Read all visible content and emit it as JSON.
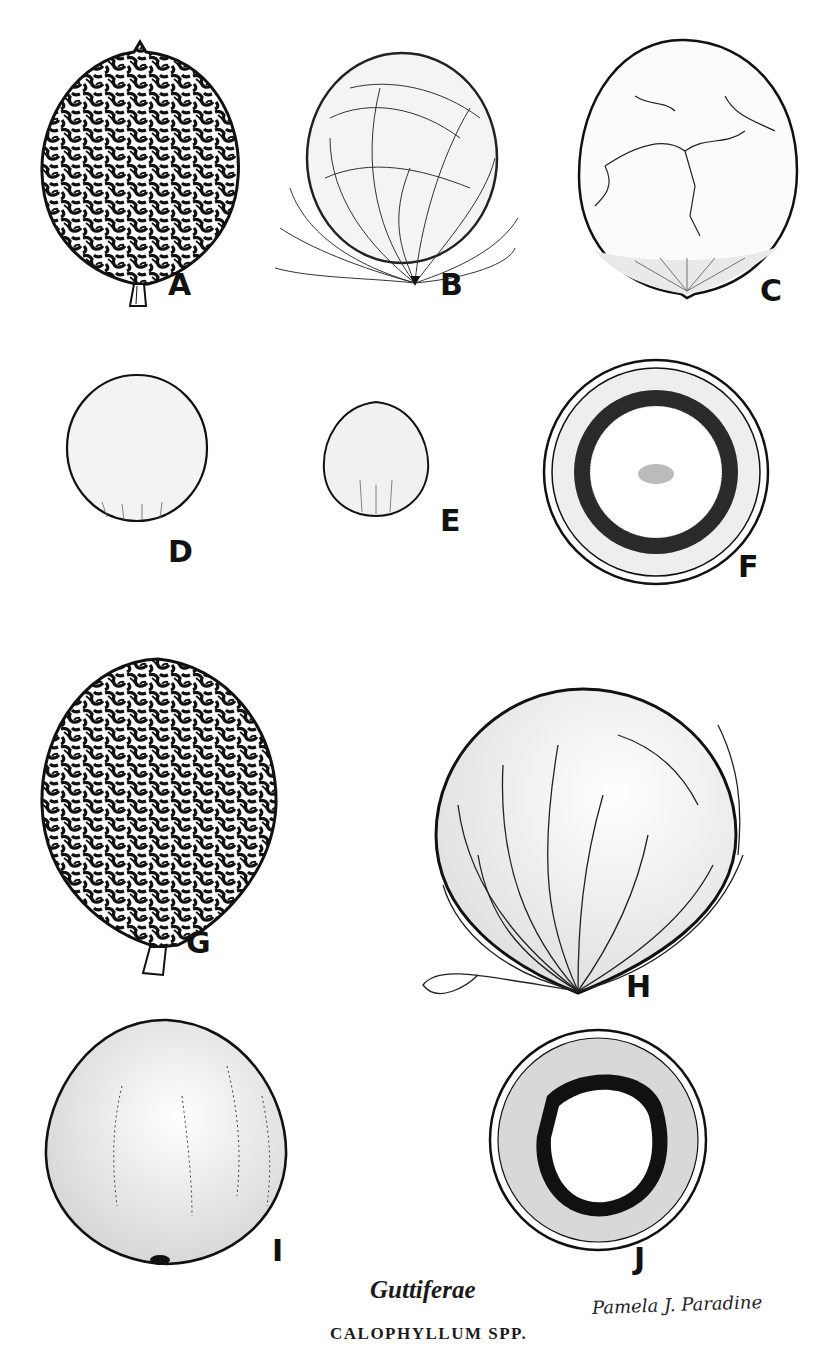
{
  "plate": {
    "family": "Guttiferae",
    "genus": "CALOPHYLLUM SPP.",
    "artist_signature": "Pamela J. Paradine"
  },
  "figures": [
    {
      "id": "A",
      "label": "A",
      "description": "reticulate-ridged fruit with stalk"
    },
    {
      "id": "B",
      "label": "B",
      "description": "fibrous-covered fruit"
    },
    {
      "id": "C",
      "label": "C",
      "description": "smooth cracked fruit"
    },
    {
      "id": "D",
      "label": "D",
      "description": "smooth seed"
    },
    {
      "id": "E",
      "label": "E",
      "description": "small smooth seed"
    },
    {
      "id": "F",
      "label": "F",
      "description": "fruit cross-section"
    },
    {
      "id": "G",
      "label": "G",
      "description": "large reticulate-ridged fruit with stalk"
    },
    {
      "id": "H",
      "label": "H",
      "description": "large fibrous-covered fruit"
    },
    {
      "id": "I",
      "label": "I",
      "description": "large smooth seed"
    },
    {
      "id": "J",
      "label": "J",
      "description": "large fruit cross-section"
    }
  ]
}
